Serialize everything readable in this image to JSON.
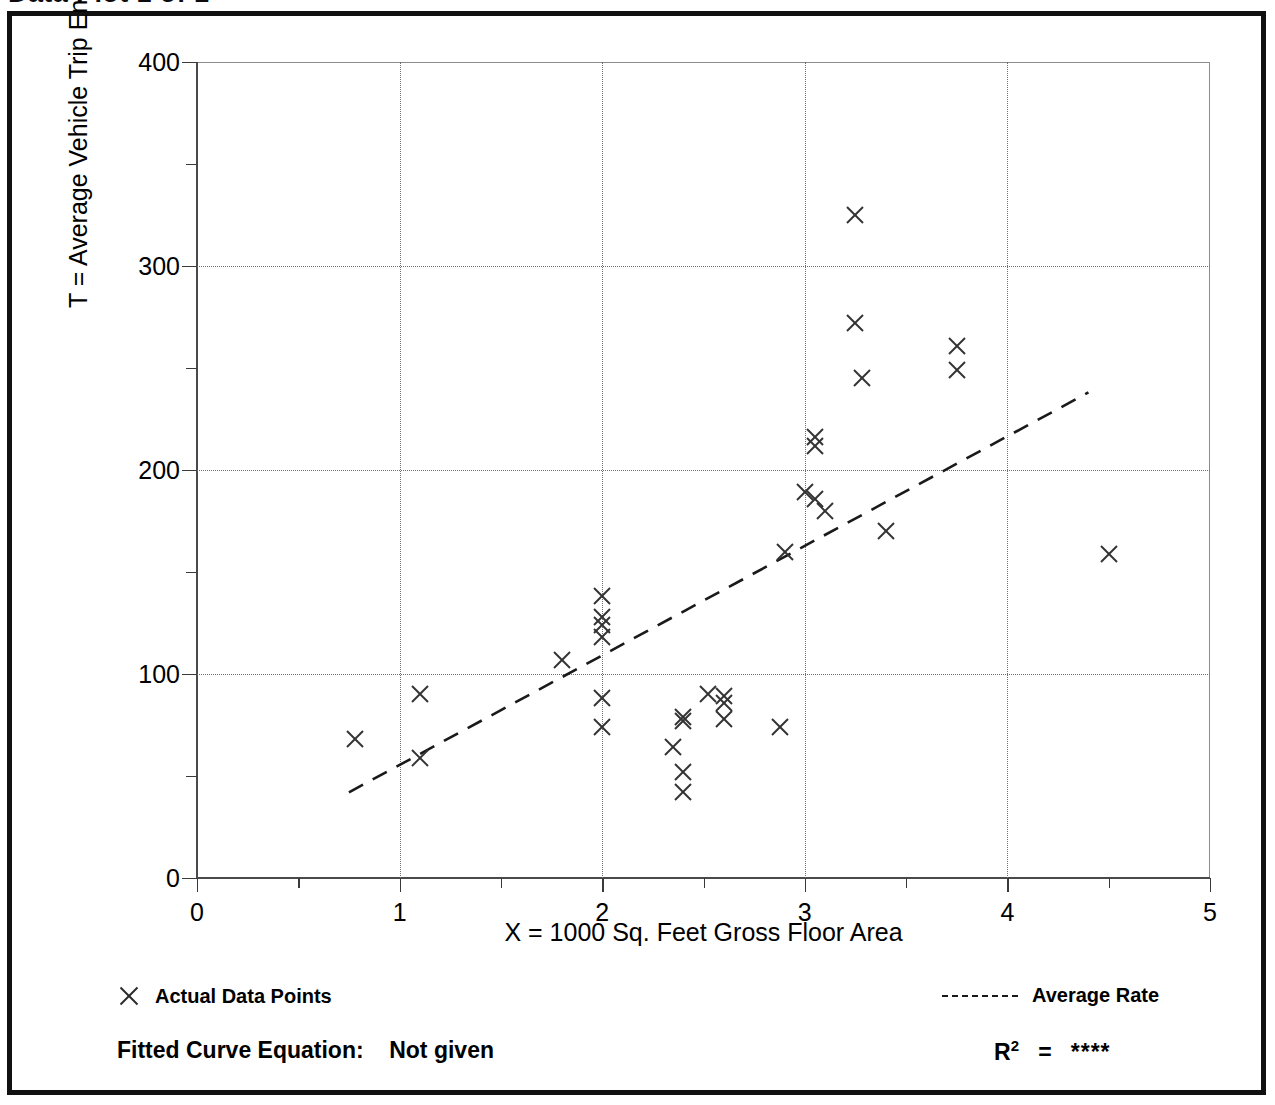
{
  "figure": {
    "clipped_title": "Data Plot 1 of 1",
    "frame_color": "#111111"
  },
  "chart_data": {
    "type": "scatter",
    "title": "",
    "xlabel": "X = 1000 Sq. Feet Gross Floor Area",
    "ylabel": "T = Average Vehicle Trip Ends",
    "xlim": [
      0,
      5
    ],
    "ylim": [
      0,
      400
    ],
    "xticks": [
      0,
      1,
      2,
      3,
      4,
      5
    ],
    "xtick_labels": [
      "0",
      "1",
      "2",
      "3",
      "4",
      "5"
    ],
    "xticks_minor": [
      0.5,
      1.5,
      2.5,
      3.5,
      4.5
    ],
    "yticks": [
      0,
      100,
      200,
      300,
      400
    ],
    "ytick_labels": [
      "0",
      "100",
      "200",
      "300",
      "400"
    ],
    "yticks_minor": [
      50,
      150,
      250,
      350
    ],
    "grid": true,
    "grid_style": "dotted",
    "grid_x_values": [
      1,
      2,
      3,
      4
    ],
    "grid_y_values": [
      100,
      200,
      300
    ],
    "legend_position": "below-plot",
    "series": [
      {
        "name": "Actual Data Points",
        "type": "scatter",
        "marker": "x",
        "color": "#333333",
        "points": [
          [
            0.78,
            68
          ],
          [
            1.1,
            90
          ],
          [
            1.1,
            59
          ],
          [
            1.8,
            107
          ],
          [
            2.0,
            138
          ],
          [
            2.0,
            128
          ],
          [
            2.0,
            124
          ],
          [
            2.0,
            118
          ],
          [
            2.0,
            88
          ],
          [
            2.0,
            74
          ],
          [
            2.35,
            64
          ],
          [
            2.4,
            79
          ],
          [
            2.4,
            77
          ],
          [
            2.4,
            52
          ],
          [
            2.4,
            42
          ],
          [
            2.52,
            90
          ],
          [
            2.6,
            89
          ],
          [
            2.6,
            86
          ],
          [
            2.6,
            78
          ],
          [
            2.88,
            74
          ],
          [
            2.9,
            160
          ],
          [
            3.0,
            189
          ],
          [
            3.05,
            216
          ],
          [
            3.05,
            212
          ],
          [
            3.05,
            186
          ],
          [
            3.1,
            180
          ],
          [
            3.25,
            325
          ],
          [
            3.25,
            272
          ],
          [
            3.28,
            245
          ],
          [
            3.4,
            170
          ],
          [
            3.75,
            261
          ],
          [
            3.75,
            249
          ],
          [
            4.5,
            159
          ]
        ]
      },
      {
        "name": "Average Rate",
        "type": "line",
        "style": "dashed",
        "color": "#1a1a1a",
        "endpoints": [
          [
            0.75,
            42
          ],
          [
            4.4,
            238
          ]
        ]
      }
    ]
  },
  "legend": {
    "points_label": "Actual Data Points",
    "line_label": "Average Rate",
    "points_marker_icon": "x-marker-icon",
    "line_marker_icon": "dashed-line-icon"
  },
  "footer": {
    "fitted_equation_label": "Fitted Curve Equation:",
    "fitted_equation_value": "Not given",
    "r_squared_label": "R",
    "r_squared_exponent": "2",
    "r_squared_equals": "=",
    "r_squared_value": "****"
  }
}
